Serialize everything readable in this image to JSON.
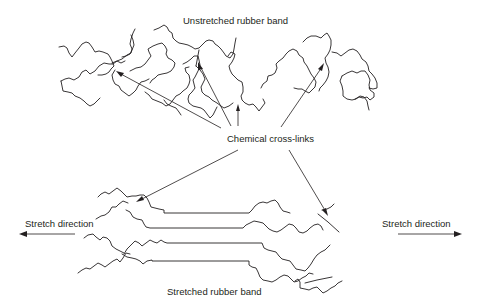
{
  "diagram": {
    "title_top": "Unstretched rubber band",
    "title_bottom": "Stretched rubber band",
    "crosslink_label": "Chemical cross-links",
    "stretch_left_label": "Stretch direction",
    "stretch_right_label": "Stretch direction",
    "colors": {
      "line": "#231f20",
      "background": "#ffffff"
    },
    "nodes": [
      {
        "id": "unstretched",
        "label": "Unstretched rubber band",
        "type": "polymer-network-coiled"
      },
      {
        "id": "crosslinks",
        "label": "Chemical cross-links",
        "type": "annotation"
      },
      {
        "id": "stretched",
        "label": "Stretched rubber band",
        "type": "polymer-network-aligned"
      },
      {
        "id": "stretch-left",
        "label": "Stretch direction",
        "type": "arrow-left"
      },
      {
        "id": "stretch-right",
        "label": "Stretch direction",
        "type": "arrow-right"
      }
    ],
    "edges": [
      {
        "from": "crosslinks",
        "to": "unstretched",
        "count": 4
      },
      {
        "from": "crosslinks",
        "to": "stretched",
        "count": 2
      }
    ]
  }
}
